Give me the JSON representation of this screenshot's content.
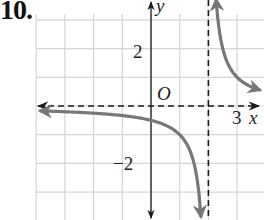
{
  "problem": {
    "number": "10."
  },
  "chart_data": {
    "type": "line",
    "title": "",
    "function_hint": "y = 1/(x - 2)",
    "xlabel": "x",
    "ylabel": "y",
    "origin_label": "O",
    "xlim": [
      -4,
      3.9
    ],
    "ylim": [
      -3.9,
      3.8
    ],
    "grid": true,
    "grid_step": 1,
    "tick_labels": {
      "x": [
        {
          "value": 3,
          "label": "3"
        }
      ],
      "y": [
        {
          "value": 2,
          "label": "2"
        },
        {
          "value": -2,
          "label": "−2"
        }
      ]
    },
    "asymptotes": {
      "vertical": [
        {
          "x": 2,
          "style": "dashed"
        }
      ],
      "horizontal": [
        {
          "y": 0,
          "style": "dashed"
        }
      ]
    },
    "series": [
      {
        "name": "left-branch",
        "x": [
          -4,
          -3,
          -2,
          -1,
          0,
          0.5,
          1,
          1.3,
          1.6,
          1.73
        ],
        "y": [
          -0.17,
          -0.2,
          -0.25,
          -0.33,
          -0.5,
          -0.67,
          -1,
          -1.43,
          -2.5,
          -3.7
        ],
        "color": "#777777",
        "arrows": "both"
      },
      {
        "name": "right-branch",
        "x": [
          2.26,
          2.4,
          2.6,
          3,
          3.5,
          3.9
        ],
        "y": [
          3.8,
          2.5,
          1.67,
          1,
          0.67,
          0.53
        ],
        "color": "#777777",
        "arrows": "both"
      }
    ]
  },
  "colors": {
    "grid": "#d4d4d4",
    "axis": "#1a1a1a",
    "curve": "#777777"
  }
}
